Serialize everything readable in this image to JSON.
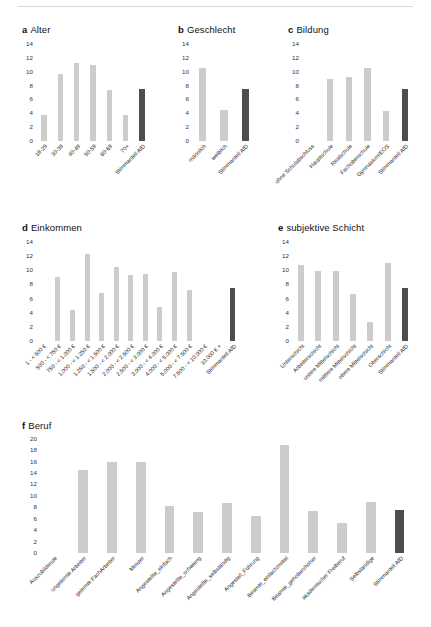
{
  "figure": {
    "background": "#ffffff",
    "bar_color": "#cccccc",
    "highlight_color": "#4d4d4d"
  },
  "chart_data": [
    {
      "type": "bar",
      "panel": "a",
      "title": "Alter",
      "xlabel": "",
      "ylabel": "",
      "ylim": [
        0,
        15
      ],
      "yticks": [
        0,
        2,
        4,
        6,
        8,
        10,
        12,
        14
      ],
      "grid": false,
      "legend": "none",
      "categories": [
        "18-29",
        "30-39",
        "40-49",
        "50-59",
        "60-69",
        "70+",
        "Stimmanteil AfD"
      ],
      "values": [
        3.8,
        9.7,
        11.2,
        11.0,
        7.4,
        3.7,
        7.5
      ],
      "highlight_index": 6
    },
    {
      "type": "bar",
      "panel": "b",
      "title": "Geschlecht",
      "xlabel": "",
      "ylabel": "",
      "ylim": [
        0,
        15
      ],
      "yticks": [
        0,
        2,
        4,
        6,
        8,
        10,
        12,
        14
      ],
      "grid": false,
      "legend": "none",
      "categories": [
        "männlich",
        "weiblich",
        "Stimmanteil AfD"
      ],
      "values": [
        10.5,
        4.5,
        7.5
      ],
      "highlight_index": 2
    },
    {
      "type": "bar",
      "panel": "c",
      "title": "Bildung",
      "xlabel": "",
      "ylabel": "",
      "ylim": [
        0,
        15
      ],
      "yticks": [
        0,
        2,
        4,
        6,
        8,
        10,
        12,
        14
      ],
      "grid": false,
      "legend": "none",
      "categories": [
        "ohne Schulabschluss",
        "Hauptschule",
        "Realschule",
        "Fachoberschule",
        "Gymnasium/EOS",
        "Stimmanteil AfD"
      ],
      "values": [
        0,
        9.0,
        9.2,
        10.5,
        4.4,
        7.5
      ],
      "highlight_index": 5
    },
    {
      "type": "bar",
      "panel": "d",
      "title": "Einkommen",
      "xlabel": "",
      "ylabel": "",
      "ylim": [
        0,
        15
      ],
      "yticks": [
        0,
        2,
        4,
        6,
        8,
        10,
        12,
        14
      ],
      "grid": false,
      "legend": "none",
      "categories": [
        "1 - < 500 €",
        "500 - < 750 €",
        "750 - < 1.000 €",
        "1.000 - < 1.250 €",
        "1.250 - < 1.500 €",
        "1.500 - < 2.000 €",
        "2.000 - < 2.500 €",
        "2.500 - < 3.000 €",
        "3.000 - < 4.000 €",
        "4.000 - < 5.000 €",
        "5.000 - < 7.500 €",
        "7.500 - < 10.000 €",
        "10.000 € +",
        "Stimmanteil AfD"
      ],
      "values": [
        0,
        9.0,
        4.4,
        12.3,
        6.8,
        10.5,
        9.4,
        9.5,
        4.8,
        9.7,
        7.2,
        0,
        0,
        7.5
      ],
      "highlight_index": 13
    },
    {
      "type": "bar",
      "panel": "e",
      "title": "subjektive Schicht",
      "xlabel": "",
      "ylabel": "",
      "ylim": [
        0,
        15
      ],
      "yticks": [
        0,
        2,
        4,
        6,
        8,
        10,
        12,
        14
      ],
      "grid": false,
      "legend": "none",
      "categories": [
        "Unterschicht",
        "Arbeiterschicht",
        "untere Mittelschicht",
        "mittlere Mittelschicht",
        "obere Mittelschicht",
        "Oberschicht",
        "Stimmanteil AfD"
      ],
      "values": [
        10.7,
        9.9,
        9.9,
        6.7,
        2.7,
        11.0,
        7.5
      ],
      "highlight_index": 6
    },
    {
      "type": "bar",
      "panel": "f",
      "title": "Beruf",
      "xlabel": "",
      "ylabel": "",
      "ylim": [
        0,
        21
      ],
      "yticks": [
        0,
        2,
        4,
        6,
        8,
        10,
        12,
        14,
        16,
        18,
        20
      ],
      "grid": false,
      "legend": "none",
      "categories": [
        "Auszubildende",
        "ungelernte Arbeiter",
        "gelernte FachArbeiter",
        "Meister",
        "Angestellte_einfach",
        "Angestellte_schwierig",
        "Angestellte_selbständig",
        "Angestell_Führung",
        "Beamte_einfach/mittel",
        "Beamte_gehoben/höher",
        "akademischer Freiberuf",
        "Selbständige",
        "Stimmanteil AfD"
      ],
      "values": [
        0,
        14.6,
        16.0,
        16.0,
        8.2,
        7.1,
        8.8,
        6.4,
        18.9,
        7.3,
        5.2,
        8.9,
        7.5
      ],
      "highlight_index": 12
    }
  ]
}
